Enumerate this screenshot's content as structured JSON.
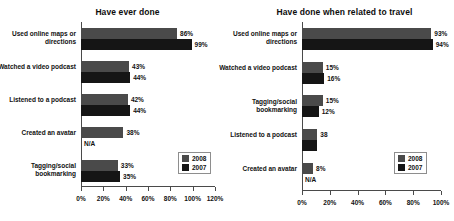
{
  "chart_data": [
    {
      "type": "bar",
      "orientation": "horizontal",
      "title": "Have ever done",
      "xlabel": "",
      "ylabel": "",
      "xlim": [
        0,
        120
      ],
      "ticks": [
        "0%",
        "20%",
        "40%",
        "60%",
        "80%",
        "100%",
        "120%"
      ],
      "tick_values": [
        0,
        20,
        40,
        60,
        80,
        100,
        120
      ],
      "grid": false,
      "legend": {
        "position": "bottom-right",
        "entries": [
          "2008",
          "2007"
        ]
      },
      "categories": [
        "Used online maps or directions",
        "Watched a video podcast",
        "Listened to a podcast",
        "Created an avatar",
        "Tagging/social bookmarking"
      ],
      "series": [
        {
          "name": "2008",
          "values": [
            86,
            43,
            42,
            38,
            33
          ],
          "labels": [
            "86%",
            "43%",
            "42%",
            "38%",
            "33%"
          ],
          "color": "#4a4a4a"
        },
        {
          "name": "2007",
          "values": [
            99,
            44,
            44,
            0,
            35
          ],
          "labels": [
            "99%",
            "44%",
            "44%",
            "N/A",
            "35%"
          ],
          "color": "#151515"
        }
      ]
    },
    {
      "type": "bar",
      "orientation": "horizontal",
      "title": "Have done when related to travel",
      "xlabel": "",
      "ylabel": "",
      "xlim": [
        0,
        100
      ],
      "ticks": [
        "0%",
        "20%",
        "40%",
        "60%",
        "80%",
        "100%"
      ],
      "tick_values": [
        0,
        20,
        40,
        60,
        80,
        100
      ],
      "grid": false,
      "legend": {
        "position": "bottom-right",
        "entries": [
          "2008",
          "2007"
        ]
      },
      "categories": [
        "Used online maps or directions",
        "Watched a video podcast",
        "Tagging/social bookmarking",
        "Listened to a podcast",
        "Created an avatar"
      ],
      "series": [
        {
          "name": "2008",
          "values": [
            93,
            15,
            15,
            11,
            8
          ],
          "labels": [
            "93%",
            "15%",
            "15%",
            "38",
            "8%"
          ],
          "color": "#4a4a4a"
        },
        {
          "name": "2007",
          "values": [
            94,
            16,
            12,
            11,
            0
          ],
          "labels": [
            "94%",
            "16%",
            "12%",
            "",
            "N/A"
          ],
          "color": "#151515"
        }
      ]
    }
  ],
  "colors": {
    "series_2008": "#4a4a4a",
    "series_2007": "#151515",
    "axis": "#4a4a4a",
    "text": "#111111",
    "background": "#ffffff"
  }
}
